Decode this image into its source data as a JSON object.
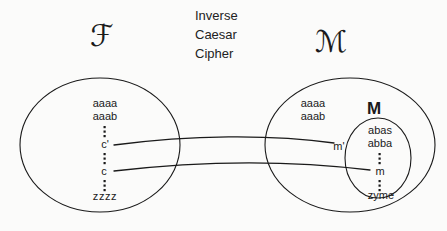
{
  "figure": {
    "title_lines": [
      "Inverse",
      "Caesar",
      "Cipher"
    ],
    "background_color": "#fbfbfa",
    "ink_color": "#1a1a1a"
  },
  "labels": {
    "ciphertext_set_symbol": "ℱ",
    "ciphertext_set_symbol_name": "script-capital-C",
    "message_set_symbol": "ℳ",
    "message_set_symbol_name": "script-capital-M",
    "meaningful_set_symbol": "M"
  },
  "left_set": {
    "name": "ciphertext-space",
    "items": [
      "aaaa",
      "aaab",
      "c'",
      "c",
      "zzzz"
    ],
    "ellipsis_marks": 3
  },
  "right_outer_set": {
    "name": "message-space",
    "items": [
      "aaaa",
      "aaab",
      "m'"
    ]
  },
  "right_inner_set": {
    "name": "meaningful-message-set",
    "label": "M",
    "items": [
      "abas",
      "abba",
      "m",
      "zyme"
    ],
    "ellipsis_marks": 2
  },
  "mappings": [
    {
      "name": "mapping-c-prime-to-m-prime",
      "from": "c'",
      "to": "m'"
    },
    {
      "name": "mapping-c-to-m",
      "from": "c",
      "to": "m"
    }
  ]
}
